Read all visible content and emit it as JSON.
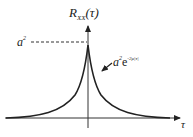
{
  "diagram": {
    "title_main": "R",
    "title_sub": "XX",
    "title_arg": "(τ)",
    "peak_label": "a",
    "peak_sup": "2",
    "curve_label_base": "a",
    "curve_label_sup": "2",
    "curve_label_e": "e",
    "curve_label_exp": "-2μ|τ|",
    "x_axis_label": "τ",
    "colors": {
      "line": "#222222",
      "dashed": "#333333"
    }
  }
}
